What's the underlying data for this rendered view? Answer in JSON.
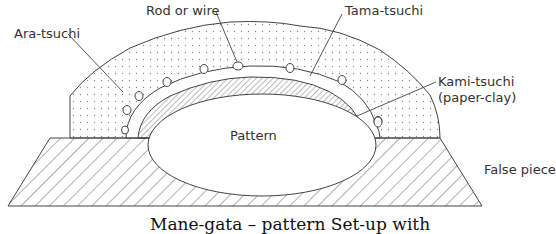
{
  "diagram": {
    "labels": {
      "ara_tsuchi": "Ara-tsuchi",
      "rod_or_wire": "Rod or wire",
      "tama_tsuchi": "Tama-tsuchi",
      "kami_tsuchi": "Kami-tsuchi",
      "kami_tsuchi_sub": "(paper-clay)",
      "pattern": "Pattern",
      "false_piece": "False piece"
    },
    "caption": "Mane-gata – pattern Set-up with",
    "colors": {
      "line": "#444444",
      "background": "#ffffff",
      "dots": "#888888"
    }
  }
}
